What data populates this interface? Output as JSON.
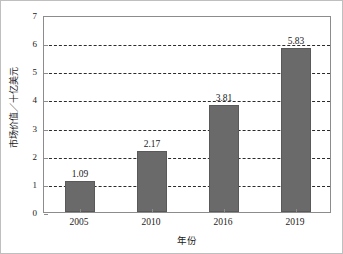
{
  "chart_data": {
    "type": "bar",
    "title": "",
    "categories": [
      "2005",
      "2010",
      "2016",
      "2019"
    ],
    "values": [
      1.09,
      2.17,
      3.81,
      5.83
    ],
    "data_labels": [
      "1.09",
      "2.17",
      "3.81",
      "5.83"
    ],
    "xlabel": "年份",
    "ylabel": "市场价值／十亿美元",
    "ylim": [
      0,
      7
    ],
    "yticks": [
      "0",
      "1",
      "2",
      "3",
      "4",
      "5",
      "6",
      "7"
    ],
    "ytick_values": [
      0,
      1,
      2,
      3,
      4,
      5,
      6,
      7
    ],
    "grid": "horizontal-dashed",
    "legend": "none",
    "bar_color": "#6a6a6a",
    "grid_color": "#2b2b2b",
    "axis_color": "#8c8c8c",
    "text_color": "#1a1a1a",
    "background": "#ffffff"
  }
}
